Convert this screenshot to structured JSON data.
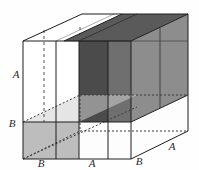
{
  "figure": {
    "type": "geometry-diagram",
    "background_color": "#fefefe",
    "projection": "oblique",
    "labels": [
      {
        "id": "label-a-left",
        "text": "A",
        "x": 16,
        "y": 78,
        "meaning": "height of box (vertical edge upper segment)"
      },
      {
        "id": "label-b-left",
        "text": "B",
        "x": 12,
        "y": 127,
        "meaning": "height of lower slab (vertical edge lower segment)"
      },
      {
        "id": "label-b-front1",
        "text": "B",
        "x": 41,
        "y": 166,
        "meaning": "front bottom edge, first segment"
      },
      {
        "id": "label-a-front",
        "text": "A",
        "x": 89,
        "y": 166,
        "meaning": "front bottom edge, middle segment"
      },
      {
        "id": "label-b-front2",
        "text": "B",
        "x": 137,
        "y": 164,
        "meaning": "front bottom edge, right segment"
      },
      {
        "id": "label-a-right",
        "text": "A",
        "x": 171,
        "y": 148,
        "meaning": "depth edge along receding direction"
      }
    ],
    "dimension_symbols": [
      "A",
      "B"
    ],
    "colors": {
      "outline": "#1e1e1e",
      "hidden_line": "#5a5a5a",
      "face_white": "#ffffff",
      "face_light_gray": "#b9b9b9",
      "face_mid_gray": "#8f8f8f",
      "face_dark_gray": "#6a6a6a",
      "face_darkest": "#4a4a4a",
      "face_top_light": "#f2f2f2"
    },
    "regions": [
      {
        "name": "top-face-white",
        "shade": "#ffffff"
      },
      {
        "name": "top-face-dark",
        "shade": "#585858"
      },
      {
        "name": "front-face-white-left",
        "shade": "#ffffff"
      },
      {
        "name": "front-face-dark-slab",
        "shade": "#4a4a4a"
      },
      {
        "name": "side-face-mid-gray",
        "shade": "#8b8b8b"
      },
      {
        "name": "bottom-slab-light",
        "shade": "#bdbdbd"
      },
      {
        "name": "bottom-front-white",
        "shade": "#fcfcfc"
      }
    ]
  }
}
